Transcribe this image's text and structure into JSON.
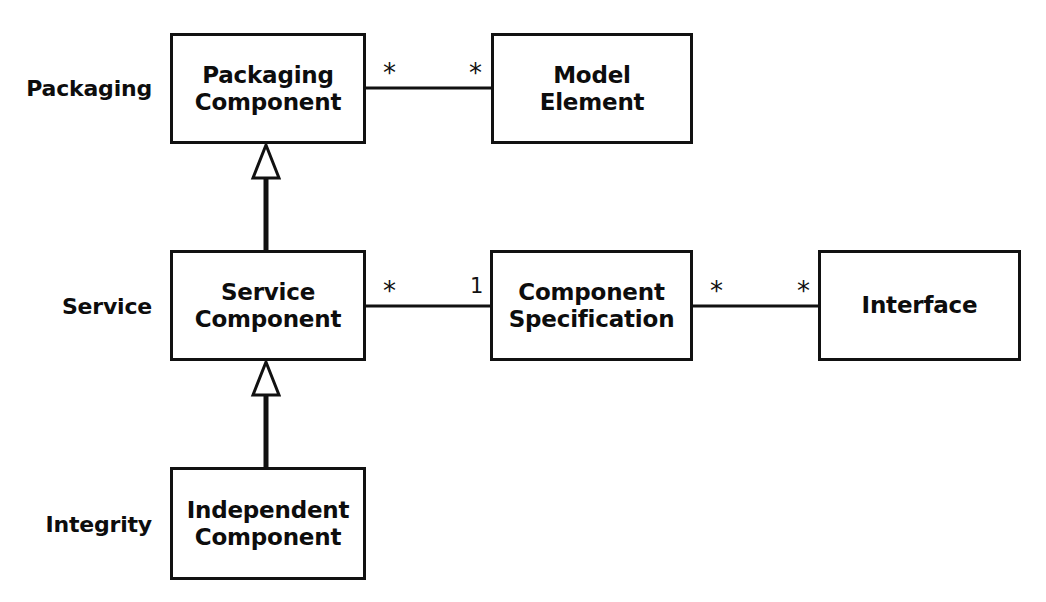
{
  "diagram": {
    "background_color": "#ffffff",
    "line_color": "#111111",
    "text_color": "#0d0d0d"
  },
  "layers": [
    {
      "id": "packaging",
      "label": "Packaging",
      "x": 152,
      "y": 88
    },
    {
      "id": "service",
      "label": "Service",
      "x": 152,
      "y": 306
    },
    {
      "id": "integrity",
      "label": "Integrity",
      "x": 152,
      "y": 524
    }
  ],
  "classes": [
    {
      "id": "packaging-component",
      "label": "Packaging\nComponent",
      "x": 170,
      "y": 33,
      "w": 196,
      "h": 111
    },
    {
      "id": "model-element",
      "label": "Model\nElement",
      "x": 491,
      "y": 33,
      "w": 202,
      "h": 111
    },
    {
      "id": "service-component",
      "label": "Service\nComponent",
      "x": 170,
      "y": 250,
      "w": 196,
      "h": 111
    },
    {
      "id": "component-specification",
      "label": "Component\nSpecification",
      "x": 490,
      "y": 250,
      "w": 203,
      "h": 111
    },
    {
      "id": "interface",
      "label": "Interface",
      "x": 818,
      "y": 250,
      "w": 203,
      "h": 111
    },
    {
      "id": "independent-component",
      "label": "Independent\nComponent",
      "x": 170,
      "y": 467,
      "w": 196,
      "h": 113
    }
  ],
  "associations": [
    {
      "id": "packaging-component--model-element",
      "from": "packaging-component",
      "to": "model-element",
      "x1": 366,
      "y1": 88,
      "x2": 491,
      "y2": 88,
      "source_multiplicity": "*",
      "target_multiplicity": "*",
      "source_mult_x": 383,
      "source_mult_y": 60,
      "target_mult_x": 469,
      "target_mult_y": 60
    },
    {
      "id": "service-component--component-specification",
      "from": "service-component",
      "to": "component-specification",
      "x1": 366,
      "y1": 306,
      "x2": 490,
      "y2": 306,
      "source_multiplicity": "*",
      "target_multiplicity": "1",
      "source_mult_x": 383,
      "source_mult_y": 278,
      "target_mult_x": 470,
      "target_mult_y": 276
    },
    {
      "id": "component-specification--interface",
      "from": "component-specification",
      "to": "interface",
      "x1": 693,
      "y1": 306,
      "x2": 818,
      "y2": 306,
      "source_multiplicity": "*",
      "target_multiplicity": "*",
      "source_mult_x": 710,
      "source_mult_y": 278,
      "target_mult_x": 797,
      "target_mult_y": 278
    }
  ],
  "generalizations": [
    {
      "id": "service-component--is-a--packaging-component",
      "child": "service-component",
      "parent": "packaging-component",
      "triangle_apex_x": 266,
      "triangle_apex_y": 145,
      "triangle_half_width": 13,
      "triangle_height": 33,
      "line_x": 266,
      "line_y1": 178,
      "line_y2": 250
    },
    {
      "id": "independent-component--is-a--service-component",
      "child": "independent-component",
      "parent": "service-component",
      "triangle_apex_x": 266,
      "triangle_apex_y": 362,
      "triangle_half_width": 13,
      "triangle_height": 33,
      "line_x": 266,
      "line_y1": 395,
      "line_y2": 467
    }
  ]
}
